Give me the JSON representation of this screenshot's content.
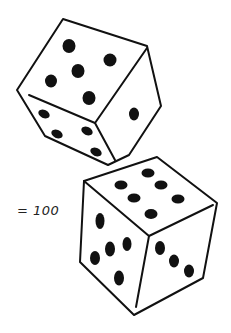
{
  "figure": {
    "equation_label": "= 100",
    "colors": {
      "stroke": "#111111",
      "pip": "#111111",
      "face": "#ffffff"
    },
    "dice": [
      {
        "name": "top-die",
        "visible_faces": {
          "top": 5,
          "left": 4,
          "right": 1
        }
      },
      {
        "name": "bottom-die",
        "visible_faces": {
          "top": 6,
          "left": 5,
          "right": 3
        }
      }
    ]
  }
}
